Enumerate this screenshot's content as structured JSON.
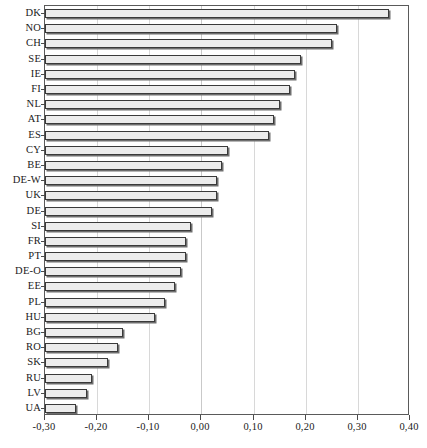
{
  "chart_data": {
    "type": "bar",
    "orientation": "horizontal",
    "title": "",
    "subtitle": "",
    "xlabel": "",
    "ylabel": "",
    "xlim": [
      -0.3,
      0.4
    ],
    "ylim": [],
    "grid": true,
    "legend": null,
    "decimal_separator": ",",
    "bar_baseline": -0.3,
    "xticks": [
      -0.3,
      -0.2,
      -0.1,
      0.0,
      0.1,
      0.2,
      0.3,
      0.4
    ],
    "xtick_labels": [
      "-0,30",
      "-0,20",
      "-0,10",
      "0,00",
      "0,10",
      "0,20",
      "0,30",
      "0,40"
    ],
    "categories": [
      "DK",
      "NO",
      "CH",
      "SE",
      "IE",
      "FI",
      "NL",
      "AT",
      "ES",
      "CY",
      "BE",
      "DE-W",
      "UK",
      "DE",
      "SI",
      "FR",
      "PT",
      "DE-O",
      "EE",
      "PL",
      "HU",
      "BG",
      "RO",
      "SK",
      "RU",
      "LV",
      "UA"
    ],
    "values": [
      0.36,
      0.26,
      0.25,
      0.19,
      0.18,
      0.17,
      0.15,
      0.14,
      0.13,
      0.05,
      0.04,
      0.03,
      0.03,
      0.02,
      -0.02,
      -0.03,
      -0.03,
      -0.04,
      -0.05,
      -0.07,
      -0.09,
      -0.15,
      -0.16,
      -0.18,
      -0.21,
      -0.22,
      -0.24
    ],
    "colors": {
      "bar_fill": "#ececec",
      "bar_edge": "#3a3a3a",
      "bar_shadow": "#6e6e6e",
      "gridline": "#d8d8d8",
      "frame": "#5a5a5a",
      "text": "#1a1a1a",
      "background": "#ffffff"
    }
  }
}
